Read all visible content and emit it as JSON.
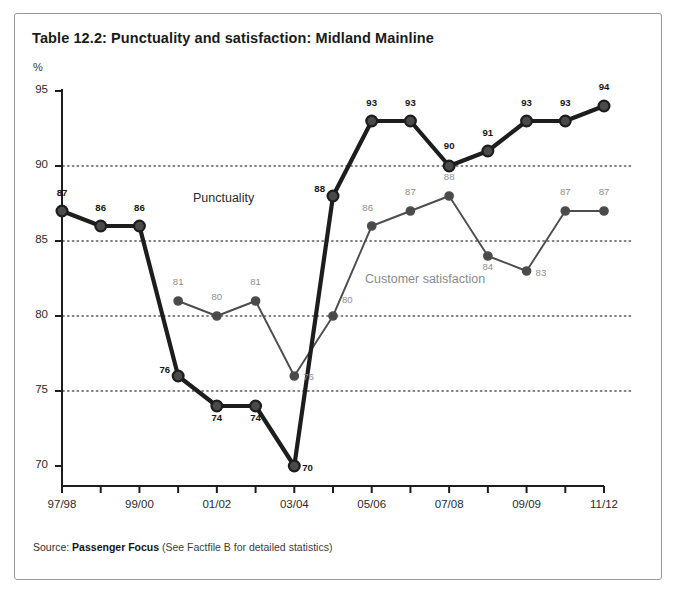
{
  "title": "Table 12.2: Punctuality and satisfaction: Midland Mainline",
  "axis": {
    "y_unit": "%",
    "y_ticks": [
      "95",
      "90",
      "85",
      "80",
      "75",
      "70"
    ],
    "x_ticks": [
      "97/98",
      "",
      "99/00",
      "",
      "01/02",
      "",
      "03/04",
      "",
      "05/06",
      "",
      "07/08",
      "",
      "09/09",
      "",
      "11/12"
    ]
  },
  "series_labels": {
    "punctuality": "Punctuality",
    "satisfaction": "Customer satisfaction"
  },
  "source": {
    "prefix": "Source:",
    "org": "Passenger Focus",
    "note": "(See Factfile B for detailed statistics)"
  },
  "colors": {
    "punctuality": "#1d1d1d",
    "satisfaction": "#4d4d4d",
    "satisfaction_label": "#8e8e8e",
    "grid": "#5a5a5a",
    "axis": "#1d1d1d",
    "frame": "#9a9a9a"
  },
  "chart_data": {
    "type": "line",
    "title": "Table 12.2: Punctuality and satisfaction: Midland Mainline",
    "xlabel": "",
    "ylabel": "%",
    "ylim": [
      68,
      96
    ],
    "yticks": [
      70,
      75,
      80,
      85,
      90,
      95
    ],
    "grid": "horizontal-dotted",
    "legend": "inline-annotations",
    "categories": [
      "97/98",
      "98/99",
      "99/00",
      "00/01",
      "01/02",
      "02/03",
      "03/04",
      "04/05",
      "05/06",
      "06/07",
      "07/08",
      "08/09",
      "09/09",
      "10/11",
      "11/12"
    ],
    "series": [
      {
        "name": "Punctuality",
        "values": [
          87,
          86,
          86,
          76,
          74,
          74,
          70,
          88,
          93,
          93,
          90,
          91,
          93,
          93,
          94
        ],
        "labels": [
          "87",
          "86",
          "86",
          "76",
          "74",
          "74",
          "70",
          "88",
          "93",
          "93",
          "90",
          "91",
          "93",
          "93",
          "94"
        ]
      },
      {
        "name": "Customer satisfaction",
        "values": [
          null,
          null,
          null,
          81,
          80,
          81,
          76,
          80,
          86,
          87,
          88,
          84,
          83,
          87,
          87
        ],
        "labels": [
          "",
          "",
          "",
          "81",
          "80",
          "81",
          "76",
          "80",
          "86",
          "87",
          "88",
          "84",
          "83",
          "87",
          "87"
        ]
      }
    ]
  }
}
